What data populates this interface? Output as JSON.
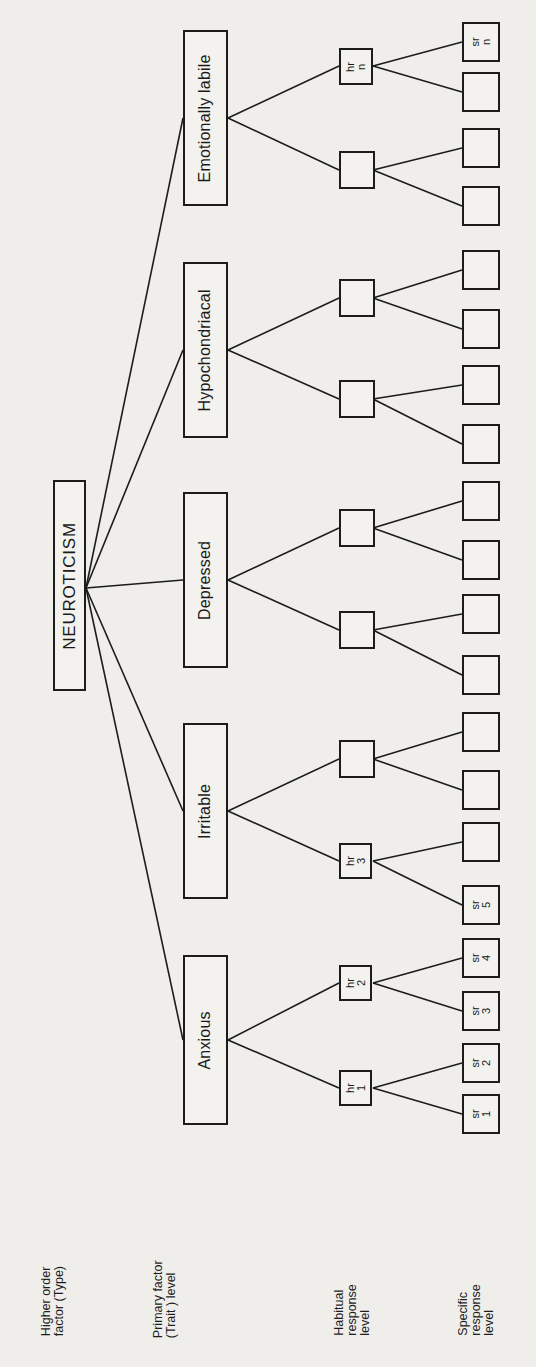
{
  "figure": {
    "background_color": "#efeeea",
    "line_color": "#1c1c1c",
    "orientation": "rotated-90-ccw"
  },
  "level_labels": [
    {
      "name": "higher-order-factor",
      "line1": "Higher order",
      "line2": "factor (Type)"
    },
    {
      "name": "primary-factor",
      "line1": "Primary factor",
      "line2": "(Trait ) level"
    },
    {
      "name": "habitual-response",
      "line1": "Habitual",
      "line2": "response",
      "line3": "level"
    },
    {
      "name": "specific-response",
      "line1": "Specific",
      "line2": "response",
      "line3": "level"
    }
  ],
  "type_factor": {
    "label": "NEUROTICISM"
  },
  "primary_factors": [
    {
      "id": "anxious",
      "label": "Anxious"
    },
    {
      "id": "irritable",
      "label": "Irritable"
    },
    {
      "id": "depressed",
      "label": "Depressed"
    },
    {
      "id": "hypochondriacal",
      "label": "Hypochondriacal"
    },
    {
      "id": "emotionally-labile",
      "label": "Emotionally labile"
    }
  ],
  "habitual_responses": [
    {
      "id": "hr1",
      "line1": "hr",
      "line2": "1"
    },
    {
      "id": "hr2",
      "line1": "hr",
      "line2": "2"
    },
    {
      "id": "hr3",
      "line1": "hr",
      "line2": "3"
    },
    {
      "id": "hr4",
      "line1": "",
      "line2": ""
    },
    {
      "id": "hr5",
      "line1": "",
      "line2": ""
    },
    {
      "id": "hr6",
      "line1": "",
      "line2": ""
    },
    {
      "id": "hr7",
      "line1": "",
      "line2": ""
    },
    {
      "id": "hr8",
      "line1": "",
      "line2": ""
    },
    {
      "id": "hr9",
      "line1": "",
      "line2": ""
    },
    {
      "id": "hrn",
      "line1": "hr",
      "line2": "n"
    }
  ],
  "specific_responses": [
    {
      "id": "sr1",
      "line1": "sr",
      "line2": "1"
    },
    {
      "id": "sr2",
      "line1": "sr",
      "line2": "2"
    },
    {
      "id": "sr3",
      "line1": "sr",
      "line2": "3"
    },
    {
      "id": "sr4",
      "line1": "sr",
      "line2": "4"
    },
    {
      "id": "sr5",
      "line1": "sr",
      "line2": "5"
    },
    {
      "id": "sr6",
      "line1": "",
      "line2": ""
    },
    {
      "id": "sr7",
      "line1": "",
      "line2": ""
    },
    {
      "id": "sr8",
      "line1": "",
      "line2": ""
    },
    {
      "id": "sr9",
      "line1": "",
      "line2": ""
    },
    {
      "id": "sr10",
      "line1": "",
      "line2": ""
    },
    {
      "id": "sr11",
      "line1": "",
      "line2": ""
    },
    {
      "id": "sr12",
      "line1": "",
      "line2": ""
    },
    {
      "id": "sr13",
      "line1": "",
      "line2": ""
    },
    {
      "id": "sr14",
      "line1": "",
      "line2": ""
    },
    {
      "id": "sr15",
      "line1": "",
      "line2": ""
    },
    {
      "id": "sr16",
      "line1": "",
      "line2": ""
    },
    {
      "id": "sr17",
      "line1": "",
      "line2": ""
    },
    {
      "id": "sr18",
      "line1": "",
      "line2": ""
    },
    {
      "id": "sr19",
      "line1": "",
      "line2": ""
    },
    {
      "id": "srn",
      "line1": "sr",
      "line2": "n"
    }
  ]
}
